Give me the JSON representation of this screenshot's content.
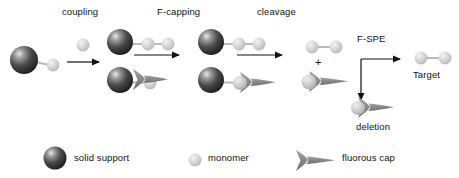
{
  "diagram": {
    "type": "process-flow",
    "step_labels": {
      "coupling": "coupling",
      "f_capping": "F-capping",
      "cleavage": "cleavage",
      "f_spe": "F-SPE"
    },
    "product_labels": {
      "target": "Target",
      "deletion": "deletion"
    },
    "plus_sign": "+",
    "legend": {
      "items": [
        {
          "key": "solid-support",
          "label": "solid support",
          "icon": "dark-sphere",
          "color": "#2b2b2b"
        },
        {
          "key": "monomer",
          "label": "monomer",
          "icon": "light-sphere",
          "color": "#c9c9c9"
        },
        {
          "key": "fluorous-cap",
          "label": "fluorous cap",
          "icon": "fork-shape",
          "color": "#8a8a8a"
        }
      ]
    },
    "colors": {
      "support_dark": "#2b2b2b",
      "support_highlight": "#d8d8d8",
      "monomer_light": "#c9c9c9",
      "monomer_highlight": "#efefef",
      "cap_gray": "#8a8a8a",
      "arrow": "#111111",
      "text": "#111111",
      "background": "#ffffff"
    },
    "species": [
      {
        "id": "start-resin",
        "label": "solid support with monomer",
        "parts": [
          "solid-support",
          "monomer"
        ]
      },
      {
        "id": "free-monomer",
        "label": "free monomer",
        "parts": [
          "monomer"
        ]
      },
      {
        "id": "coupled-dimer-on-resin",
        "label": "solid support with two monomers",
        "parts": [
          "solid-support",
          "monomer",
          "monomer"
        ]
      },
      {
        "id": "uncoupled-resin",
        "label": "solid support with single monomer",
        "parts": [
          "solid-support",
          "monomer"
        ]
      },
      {
        "id": "free-cap",
        "label": "free fluorous cap",
        "parts": [
          "fluorous-cap"
        ]
      },
      {
        "id": "capped-resin",
        "label": "solid support with monomer and fluorous cap",
        "parts": [
          "solid-support",
          "monomer",
          "fluorous-cap"
        ]
      },
      {
        "id": "cleaved-dimer",
        "label": "cleaved dimer",
        "parts": [
          "monomer",
          "monomer"
        ]
      },
      {
        "id": "cleaved-capped-monomer",
        "label": "cleaved capped monomer",
        "parts": [
          "monomer",
          "fluorous-cap"
        ]
      },
      {
        "id": "target-dimer",
        "label": "target dimer",
        "parts": [
          "monomer",
          "monomer"
        ]
      },
      {
        "id": "deletion-product",
        "label": "deletion product",
        "parts": [
          "monomer",
          "fluorous-cap"
        ]
      }
    ]
  }
}
